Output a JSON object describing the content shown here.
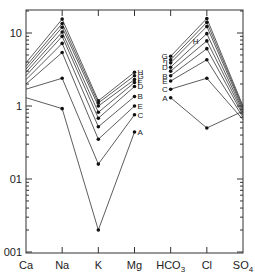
{
  "chart_data": {
    "type": "line",
    "title": "",
    "xlabel": "",
    "ylabel": "",
    "yscale": "log",
    "ylim": [
      0.01,
      20
    ],
    "grid": false,
    "categories": [
      "Ca",
      "Na",
      "K",
      "Mg",
      "HCO3",
      "Cl",
      "SO4"
    ],
    "x_tick_labels": [
      {
        "main": "Ca",
        "sub": ""
      },
      {
        "main": "Na",
        "sub": ""
      },
      {
        "main": "K",
        "sub": ""
      },
      {
        "main": "Mg",
        "sub": ""
      },
      {
        "main": "HCO",
        "sub": "3"
      },
      {
        "main": "Cl",
        "sub": ""
      },
      {
        "main": "SO",
        "sub": "4"
      }
    ],
    "y_tick_labels": [
      {
        "value": 10,
        "label": "10"
      },
      {
        "value": 1,
        "label": "1"
      },
      {
        "value": 0.1,
        "label": "01"
      },
      {
        "value": 0.01,
        "label": "001"
      }
    ],
    "cation_series": [
      {
        "name": "1",
        "values": [
          3.9,
          15.5,
          1.18,
          null
        ]
      },
      {
        "name": "2",
        "values": [
          3.5,
          13.5,
          1.1,
          null
        ]
      },
      {
        "name": "3",
        "values": [
          3.2,
          12.0,
          1.0,
          null
        ]
      },
      {
        "name": "4",
        "values": [
          2.9,
          10.3,
          0.82,
          null
        ]
      },
      {
        "name": "5",
        "values": [
          2.6,
          9.0,
          0.68,
          null
        ]
      },
      {
        "name": "6",
        "values": [
          2.3,
          7.2,
          0.52,
          null
        ]
      },
      {
        "name": "7",
        "values": [
          2.0,
          5.4,
          0.35,
          null
        ]
      },
      {
        "name": "8",
        "values": [
          1.7,
          2.4,
          0.16,
          null
        ]
      },
      {
        "name": "9",
        "values": [
          1.3,
          0.92,
          0.02,
          null
        ]
      }
    ],
    "mg_series": [
      {
        "name": "H",
        "k": 1.18,
        "mg": 2.9
      },
      {
        "name": "G",
        "k": 1.1,
        "mg": 2.6
      },
      {
        "name": "I",
        "k": 1.0,
        "mg": 2.3
      },
      {
        "name": "F",
        "k": 0.82,
        "mg": 2.1
      },
      {
        "name": "D",
        "k": 0.68,
        "mg": 1.85
      },
      {
        "name": "B",
        "k": 0.52,
        "mg": 1.35
      },
      {
        "name": "E",
        "k": 0.35,
        "mg": 1.0
      },
      {
        "name": "C",
        "k": 0.16,
        "mg": 0.76
      },
      {
        "name": "A",
        "k": 0.02,
        "mg": 0.44
      }
    ],
    "anion_series": [
      {
        "name": "G",
        "values": [
          4.8,
          15.8,
          1.0
        ]
      },
      {
        "name": "F",
        "values": [
          4.3,
          14.0,
          0.95
        ]
      },
      {
        "name": "I",
        "values": [
          3.9,
          12.3,
          0.9
        ]
      },
      {
        "name": "D",
        "values": [
          3.4,
          9.8,
          0.85
        ]
      },
      {
        "name": "H",
        "values": [
          3.0,
          7.8,
          0.8
        ]
      },
      {
        "name": "B",
        "values": [
          2.6,
          6.1,
          0.75
        ]
      },
      {
        "name": "E",
        "values": [
          2.2,
          4.3,
          0.7
        ]
      },
      {
        "name": "C",
        "values": [
          1.7,
          2.4,
          0.65
        ]
      },
      {
        "name": "A",
        "values": [
          1.3,
          0.5,
          0.85
        ]
      }
    ],
    "series_labels_mg": [
      "H",
      "G",
      "I",
      "F",
      "D",
      "B",
      "E",
      "C",
      "A"
    ],
    "series_labels_hco3": [
      "G",
      "F",
      "I",
      "D",
      "B",
      "E",
      "C",
      "A"
    ],
    "h_label_hco3": "H"
  }
}
